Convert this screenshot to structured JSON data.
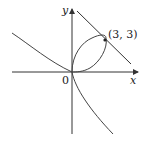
{
  "diagram": {
    "axes": {
      "x_label": "x",
      "y_label": "y",
      "origin_label": "0"
    },
    "point": {
      "label": "(3, 3)",
      "x": 3,
      "y": 3
    },
    "curve": "x^3 + y^3 = 6xy",
    "tangent_line": "x + y = 6",
    "colors": {
      "stroke": "#333333",
      "background": "#ffffff"
    }
  }
}
